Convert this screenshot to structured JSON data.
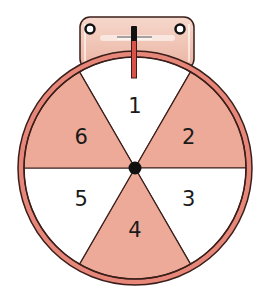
{
  "figure": {
    "type": "spinner",
    "sector_count": 6,
    "sectors": [
      {
        "label": "1",
        "shaded": false
      },
      {
        "label": "2",
        "shaded": true
      },
      {
        "label": "3",
        "shaded": false
      },
      {
        "label": "4",
        "shaded": true
      },
      {
        "label": "5",
        "shaded": false
      },
      {
        "label": "6",
        "shaded": true
      }
    ],
    "colors": {
      "shaded_sector": "#eeaa98",
      "unshaded_sector": "#ffffff",
      "rim": "#e6877a",
      "outline": "#3a1e1a",
      "hub": "#111111",
      "plate": "#f1c3b4",
      "pointer": "#d9534a"
    }
  }
}
